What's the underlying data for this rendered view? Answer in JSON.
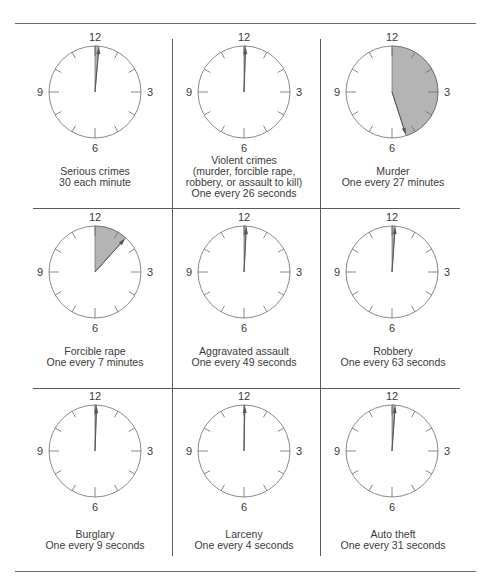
{
  "figure": {
    "clock_numbers": [
      "12",
      "3",
      "6",
      "9"
    ],
    "colors": {
      "shade": "#b4b4b4",
      "outline": "#8a8a8a",
      "hand": "#555555",
      "rule": "#6a6a6a"
    }
  },
  "cells": [
    {
      "title": "Serious crimes",
      "lines": [
        "Serious crimes",
        "30 each minute"
      ],
      "sector_deg": 5
    },
    {
      "title": "Violent crimes",
      "lines": [
        "Violent crimes",
        "(murder, forcible rape,",
        "robbery, or assault to kill)",
        "One every 26 seconds"
      ],
      "sector_deg": 2
    },
    {
      "title": "Murder",
      "lines": [
        "Murder",
        "One every 27 minutes"
      ],
      "sector_deg": 162
    },
    {
      "title": "Forcible rape",
      "lines": [
        "Forcible rape",
        "One every 7 minutes"
      ],
      "sector_deg": 42
    },
    {
      "title": "Aggravated assault",
      "lines": [
        "Aggravated assault",
        "One every 49 seconds"
      ],
      "sector_deg": 3
    },
    {
      "title": "Robbery",
      "lines": [
        "Robbery",
        "One every 63 seconds"
      ],
      "sector_deg": 4
    },
    {
      "title": "Burglary",
      "lines": [
        "Burglary",
        "One every 9 seconds"
      ],
      "sector_deg": 2
    },
    {
      "title": "Larceny",
      "lines": [
        "Larceny",
        "One every 4 seconds"
      ],
      "sector_deg": 1
    },
    {
      "title": "Auto theft",
      "lines": [
        "Auto theft",
        "One every 31 seconds"
      ],
      "sector_deg": 4
    }
  ]
}
